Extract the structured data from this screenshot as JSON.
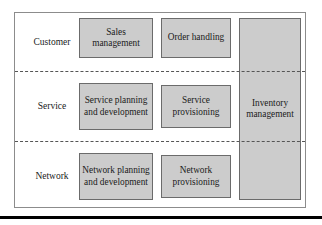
{
  "figure": {
    "rows": [
      {
        "id": "customer",
        "label": "Customer"
      },
      {
        "id": "service",
        "label": "Service"
      },
      {
        "id": "network",
        "label": "Network"
      }
    ],
    "boxes": {
      "sales_management": "Sales management",
      "order_handling": "Order handling",
      "service_planning_and_development": "Service planning and development",
      "service_provisioning": "Service provisioning",
      "network_planning_and_development": "Network planning and development",
      "network_provisioning": "Network provisioning",
      "inventory_management": "Inventory management"
    },
    "colors": {
      "box_fill": "#cccccc",
      "box_border": "#6b6b6b",
      "frame_border": "#8c8c8c",
      "divider": "#555555",
      "text": "#1a1a1a",
      "rule": "#000000",
      "background": "#ffffff"
    }
  }
}
